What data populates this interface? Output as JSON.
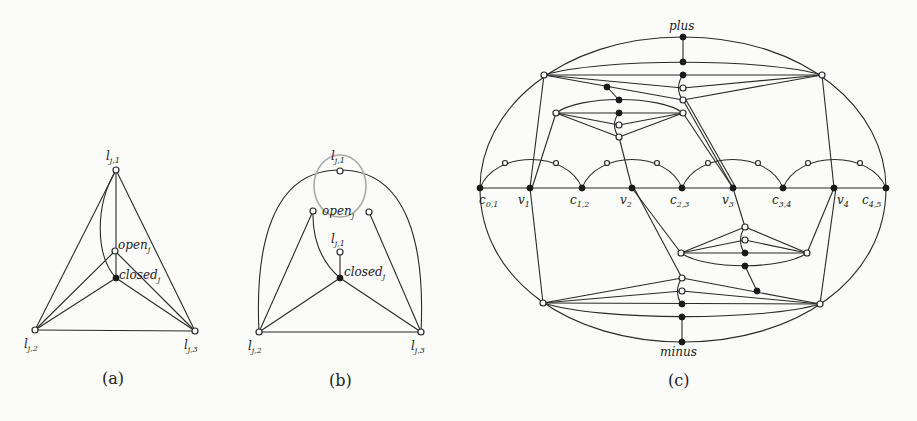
{
  "figure": {
    "panels": [
      {
        "id": "a",
        "caption": "(a)",
        "labels": {
          "l1": "l",
          "l1_sub": "j,1",
          "l2": "l",
          "l2_sub": "j,2",
          "l3": "l",
          "l3_sub": "j,3",
          "open": "open",
          "open_sub": "j",
          "closed": "closed",
          "closed_sub": "j"
        }
      },
      {
        "id": "b",
        "caption": "(b)",
        "labels": {
          "l1_top": "l",
          "l1_top_sub": "j,1",
          "l1_inner": "l",
          "l1_inner_sub": "j,1",
          "l2": "l",
          "l2_sub": "j,2",
          "l3": "l",
          "l3_sub": "j,3",
          "open": "open",
          "open_sub": "j",
          "closed": "closed",
          "closed_sub": "j"
        }
      },
      {
        "id": "c",
        "caption": "(c)",
        "labels": {
          "plus": "plus",
          "minus": "minus",
          "baseline": [
            {
              "main": "c",
              "sub": "0,1"
            },
            {
              "main": "v",
              "sub": "1"
            },
            {
              "main": "c",
              "sub": "1,2"
            },
            {
              "main": "v",
              "sub": "2"
            },
            {
              "main": "c",
              "sub": "2,3"
            },
            {
              "main": "v",
              "sub": "3"
            },
            {
              "main": "c",
              "sub": "3,4"
            },
            {
              "main": "v",
              "sub": "4"
            },
            {
              "main": "c",
              "sub": "4,5"
            }
          ]
        }
      }
    ],
    "colors": {
      "edge": "#2a2a2a",
      "highlight_edge": "#aaaaaa",
      "background": "#fbfbf9"
    }
  }
}
